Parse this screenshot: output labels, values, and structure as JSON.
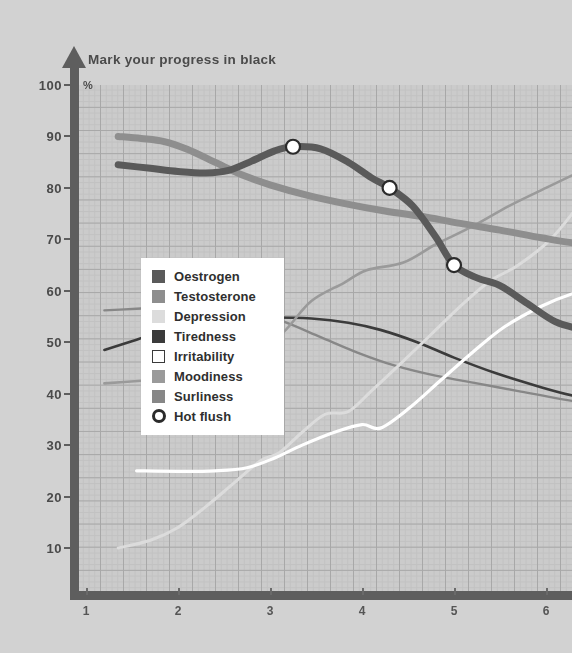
{
  "chart": {
    "title": "Mark your progress in black",
    "unit_label": "%"
  },
  "colors": {
    "page_background": "#d2d2d2",
    "plot_background": "#cbcbcb",
    "grid_minor": "#c2c2c2",
    "grid_major": "#a8a8a8",
    "axis": "#5e5e5e",
    "tick_text": "#4a4a4a",
    "legend_background": "#ffffff",
    "legend_text": "#2f2f2f",
    "oestrogen": "#5a5a5a",
    "testosterone": "#8e8e8e",
    "depression": "#dcdcdc",
    "tiredness": "#3b3b3b",
    "irritability": "#ffffff",
    "moodiness": "#9a9a9a",
    "surliness": "#878787",
    "hot_flush_ring": "#2b2b2b",
    "hot_flush_fill": "#ffffff"
  },
  "legend": {
    "items": [
      {
        "label": "Oestrogen",
        "swatch": "filled",
        "color": "#5a5a5a",
        "name": "legend-swatch-oestrogen"
      },
      {
        "label": "Testosterone",
        "swatch": "filled",
        "color": "#8e8e8e",
        "name": "legend-swatch-testosterone"
      },
      {
        "label": "Depression",
        "swatch": "filled",
        "color": "#dcdcdc",
        "name": "legend-swatch-depression"
      },
      {
        "label": "Tiredness",
        "swatch": "filled",
        "color": "#3b3b3b",
        "name": "legend-swatch-tiredness"
      },
      {
        "label": "Irritability",
        "swatch": "outline",
        "color": "#ffffff",
        "name": "legend-swatch-irritability"
      },
      {
        "label": "Moodiness",
        "swatch": "filled",
        "color": "#9a9a9a",
        "name": "legend-swatch-moodiness"
      },
      {
        "label": "Surliness",
        "swatch": "filled",
        "color": "#878787",
        "name": "legend-swatch-surliness"
      },
      {
        "label": "Hot flush",
        "swatch": "ring",
        "color": "#2b2b2b",
        "name": "legend-swatch-hot-flush"
      }
    ]
  },
  "chart_data": {
    "type": "line",
    "title": "Mark your progress in black",
    "xlabel": "",
    "ylabel": "%",
    "xlim": [
      0.75,
      6.65
    ],
    "ylim": [
      0,
      103
    ],
    "xticks": [
      1,
      2,
      3,
      4,
      5,
      6
    ],
    "yticks": [
      10,
      20,
      30,
      40,
      50,
      60,
      70,
      80,
      90,
      100
    ],
    "grid": true,
    "grid_major_step_x": 0.25,
    "grid_major_step_y": 4.5,
    "legend_position": "inside-left",
    "series": [
      {
        "name": "Oestrogen",
        "color": "#5a5a5a",
        "width": 7,
        "points": [
          [
            1.35,
            84.5
          ],
          [
            1.7,
            83.8
          ],
          [
            2.0,
            83.2
          ],
          [
            2.3,
            82.9
          ],
          [
            2.55,
            83.4
          ],
          [
            2.8,
            85.2
          ],
          [
            3.05,
            87.2
          ],
          [
            3.25,
            88.0
          ],
          [
            3.55,
            87.6
          ],
          [
            3.85,
            85.0
          ],
          [
            4.1,
            82.0
          ],
          [
            4.3,
            80.0
          ],
          [
            4.55,
            76.5
          ],
          [
            4.8,
            70.5
          ],
          [
            5.0,
            65.0
          ],
          [
            5.25,
            62.5
          ],
          [
            5.5,
            61.0
          ],
          [
            5.8,
            57.5
          ],
          [
            6.1,
            54.0
          ],
          [
            6.4,
            52.5
          ],
          [
            6.65,
            52.3
          ]
        ]
      },
      {
        "name": "Testosterone",
        "color": "#8e8e8e",
        "width": 7,
        "points": [
          [
            1.35,
            90.0
          ],
          [
            1.6,
            89.6
          ],
          [
            1.85,
            89.0
          ],
          [
            2.1,
            87.5
          ],
          [
            2.4,
            85.0
          ],
          [
            2.7,
            82.5
          ],
          [
            3.0,
            80.6
          ],
          [
            3.4,
            78.6
          ],
          [
            3.8,
            77.0
          ],
          [
            4.25,
            75.5
          ],
          [
            4.7,
            74.3
          ],
          [
            5.1,
            73.0
          ],
          [
            5.5,
            71.8
          ],
          [
            5.95,
            70.3
          ],
          [
            6.3,
            69.3
          ],
          [
            6.65,
            69.0
          ]
        ]
      },
      {
        "name": "Depression",
        "color": "#dcdcdc",
        "width": 3,
        "points": [
          [
            1.35,
            10.0
          ],
          [
            1.7,
            11.5
          ],
          [
            2.0,
            14.0
          ],
          [
            2.3,
            18.0
          ],
          [
            2.6,
            22.5
          ],
          [
            2.9,
            27.0
          ],
          [
            3.1,
            28.5
          ],
          [
            3.35,
            32.5
          ],
          [
            3.6,
            36.0
          ],
          [
            3.85,
            36.5
          ],
          [
            4.1,
            40.5
          ],
          [
            4.4,
            45.5
          ],
          [
            4.75,
            51.5
          ],
          [
            5.1,
            57.5
          ],
          [
            5.4,
            62.0
          ],
          [
            5.7,
            65.0
          ],
          [
            6.05,
            70.0
          ],
          [
            6.35,
            76.5
          ],
          [
            6.65,
            83.5
          ]
        ]
      },
      {
        "name": "Tiredness",
        "color": "#3b3b3b",
        "width": 2.6,
        "points": [
          [
            1.2,
            48.5
          ],
          [
            1.55,
            50.5
          ],
          [
            1.9,
            52.5
          ],
          [
            2.25,
            54.0
          ],
          [
            2.6,
            54.6
          ],
          [
            3.0,
            54.8
          ],
          [
            3.45,
            54.6
          ],
          [
            3.85,
            53.8
          ],
          [
            4.2,
            52.4
          ],
          [
            4.6,
            50.0
          ],
          [
            5.0,
            47.0
          ],
          [
            5.45,
            44.0
          ],
          [
            5.9,
            41.5
          ],
          [
            6.3,
            39.6
          ],
          [
            6.65,
            38.8
          ]
        ]
      },
      {
        "name": "Irritability",
        "color": "#ffffff",
        "width": 3.2,
        "points": [
          [
            1.55,
            25.0
          ],
          [
            2.0,
            24.9
          ],
          [
            2.4,
            25.0
          ],
          [
            2.75,
            25.6
          ],
          [
            3.05,
            27.5
          ],
          [
            3.35,
            30.0
          ],
          [
            3.7,
            32.5
          ],
          [
            4.0,
            34.0
          ],
          [
            4.2,
            33.3
          ],
          [
            4.5,
            37.0
          ],
          [
            4.85,
            42.5
          ],
          [
            5.2,
            48.0
          ],
          [
            5.55,
            53.0
          ],
          [
            5.95,
            57.0
          ],
          [
            6.3,
            59.5
          ],
          [
            6.65,
            61.0
          ]
        ]
      },
      {
        "name": "Moodiness",
        "color": "#9a9a9a",
        "width": 2.6,
        "points": [
          [
            1.2,
            42.0
          ],
          [
            1.6,
            42.5
          ],
          [
            2.0,
            43.0
          ],
          [
            2.4,
            44.0
          ],
          [
            2.8,
            46.5
          ],
          [
            3.15,
            52.0
          ],
          [
            3.45,
            58.0
          ],
          [
            3.8,
            61.5
          ],
          [
            4.05,
            64.0
          ],
          [
            4.45,
            65.5
          ],
          [
            4.8,
            69.0
          ],
          [
            5.2,
            72.5
          ],
          [
            5.6,
            76.5
          ],
          [
            6.0,
            80.0
          ],
          [
            6.35,
            83.0
          ],
          [
            6.65,
            85.5
          ]
        ]
      },
      {
        "name": "Surliness",
        "color": "#878787",
        "width": 2.4,
        "points": [
          [
            1.2,
            56.2
          ],
          [
            1.55,
            56.5
          ],
          [
            1.9,
            56.8
          ],
          [
            2.3,
            57.0
          ],
          [
            2.75,
            56.3
          ],
          [
            3.15,
            54.0
          ],
          [
            3.55,
            51.0
          ],
          [
            3.95,
            48.0
          ],
          [
            4.35,
            45.5
          ],
          [
            4.8,
            43.5
          ],
          [
            5.25,
            42.0
          ],
          [
            5.7,
            40.5
          ],
          [
            6.15,
            39.0
          ],
          [
            6.65,
            37.5
          ]
        ]
      }
    ],
    "markers": {
      "name": "Hot flush",
      "ring_color": "#2b2b2b",
      "fill_color": "#ffffff",
      "radius": 7,
      "points": [
        [
          3.25,
          88.0
        ],
        [
          4.3,
          80.0
        ],
        [
          5.0,
          65.0
        ]
      ]
    }
  }
}
